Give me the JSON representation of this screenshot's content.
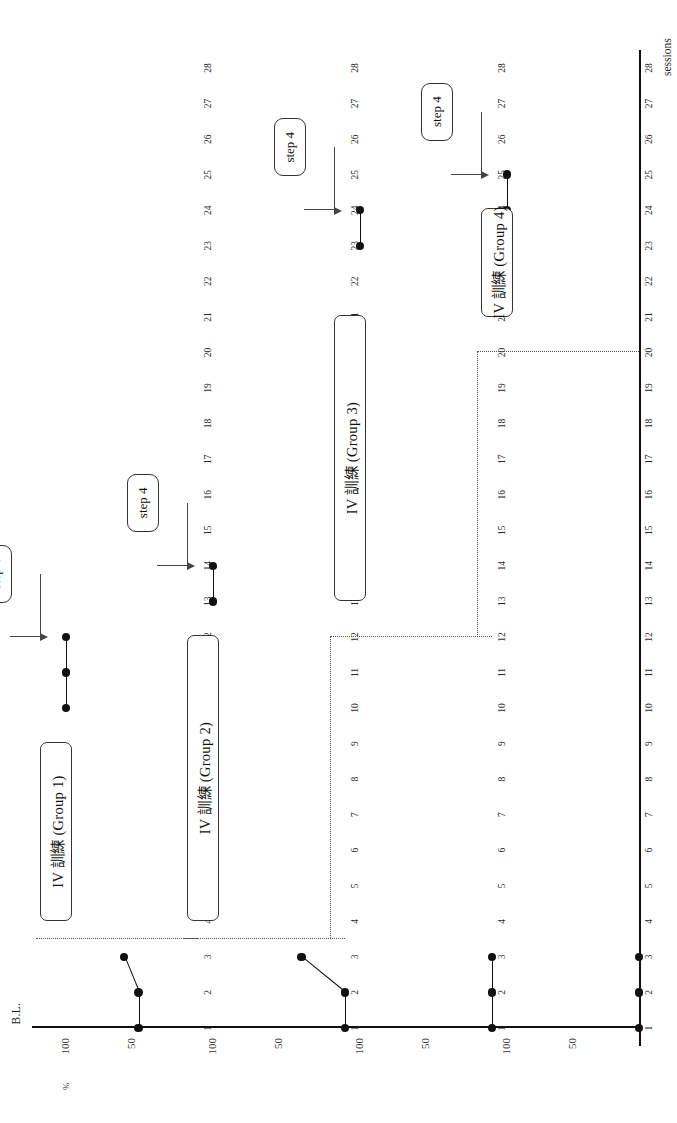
{
  "figure": {
    "y_axis_title": "correct rete of IV responses",
    "x_axis_title": "sessions",
    "percent_symbol": "%",
    "baseline_label": "B.L.",
    "y_ticks": [
      "100",
      "50"
    ],
    "x_ticks": [
      "1",
      "2",
      "3",
      "4",
      "5",
      "6",
      "7",
      "8",
      "9",
      "10",
      "11",
      "12",
      "13",
      "14",
      "15",
      "16",
      "17",
      "18",
      "19",
      "20",
      "21",
      "22",
      "23",
      "24",
      "25",
      "26",
      "27",
      "28"
    ]
  },
  "chart_data": {
    "type": "line",
    "title": "",
    "subtitle": "",
    "xlabel": "sessions",
    "ylabel": "correct rete of IV responses",
    "xlim": [
      1,
      28
    ],
    "ylim": [
      0,
      100
    ],
    "grid": false,
    "legend": "none",
    "design": "multiple-baseline across groups",
    "y_tick_values": [
      50,
      100
    ],
    "x_tick_values": [
      1,
      2,
      3,
      4,
      5,
      6,
      7,
      8,
      9,
      10,
      11,
      12,
      13,
      14,
      15,
      16,
      17,
      18,
      19,
      20,
      21,
      22,
      23,
      24,
      25,
      26,
      27,
      28
    ],
    "panels": [
      {
        "name": "Group 1",
        "intervention_label": "IV 訓練 (Group 1)",
        "intervention_start": 4,
        "intervention_end": 9,
        "phase_line_session": 3.5,
        "annotation": "step 4",
        "annotation_target_session": 12,
        "series": [
          {
            "name": "baseline",
            "x": [
              1,
              2,
              3
            ],
            "y": [
              45,
              45,
              56
            ]
          },
          {
            "name": "post-training",
            "x": [
              10,
              11,
              12
            ],
            "y": [
              100,
              100,
              100
            ]
          }
        ]
      },
      {
        "name": "Group 2",
        "intervention_label": "IV 訓練 (Group 2)",
        "intervention_start": 4,
        "intervention_end": 12,
        "phase_line_session": 3.5,
        "annotation": "step 4",
        "annotation_target_session": 14,
        "series": [
          {
            "name": "baseline",
            "x": [
              1,
              2,
              3
            ],
            "y": [
              0,
              0,
              33
            ]
          },
          {
            "name": "post-training",
            "x": [
              13,
              14
            ],
            "y": [
              100,
              100
            ]
          }
        ]
      },
      {
        "name": "Group 3",
        "intervention_label": "IV 訓練 (Group 3)",
        "intervention_start": 13,
        "intervention_end": 21,
        "phase_line_session": 12,
        "annotation": "step 4",
        "annotation_target_session": 24,
        "series": [
          {
            "name": "baseline",
            "x": [
              1,
              2,
              3
            ],
            "y": [
              0,
              0,
              0
            ]
          },
          {
            "name": "post-training",
            "x": [
              23,
              24
            ],
            "y": [
              100,
              100
            ]
          }
        ]
      },
      {
        "name": "Group 4",
        "intervention_label": "IV 訓練 (Group 4)",
        "intervention_start": 21,
        "intervention_end": 24,
        "phase_line_session": 20,
        "annotation": "step 4",
        "annotation_target_session": 25,
        "series": [
          {
            "name": "baseline",
            "x": [
              1,
              2,
              3
            ],
            "y": [
              0,
              0,
              0
            ]
          },
          {
            "name": "post-training",
            "x": [
              24,
              25
            ],
            "y": [
              100,
              100
            ]
          }
        ]
      }
    ]
  }
}
